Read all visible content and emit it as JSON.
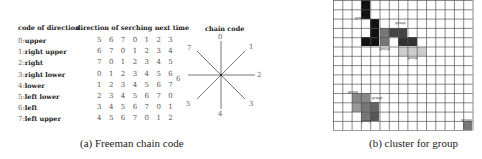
{
  "table": {
    "header_code": "code of direction",
    "header_dir": "direction of serching next time",
    "rows": [
      {
        "idx": "0:",
        "name": "upper",
        "seq": "5 6 7 0 1 2 3"
      },
      {
        "idx": "1:",
        "name": "right upper",
        "seq": "6 7 0 1 2 3 4"
      },
      {
        "idx": "2:",
        "name": "right",
        "seq": "7 0 1 2 3 4 5"
      },
      {
        "idx": "3:",
        "name": "right lower",
        "seq": "0 1 2 3 4 5 6"
      },
      {
        "idx": "4:",
        "name": "lower",
        "seq": "1 2 3 4 5 6 7"
      },
      {
        "idx": "5:",
        "name": "left lower",
        "seq": "2 3 4 5 6 7 0"
      },
      {
        "idx": "6:",
        "name": "left",
        "seq": "3 4 5 6 7 0 1"
      },
      {
        "idx": "7:",
        "name": "left upper",
        "seq": "4 5 6 7 0 1 2"
      }
    ]
  },
  "chain_code": {
    "title": "chain code",
    "directions": [
      "0",
      "1",
      "2",
      "3",
      "4",
      "5",
      "6",
      "7"
    ]
  },
  "grid": {
    "cols": 15,
    "rows": 14,
    "cell_size": 9.3,
    "filled": [
      {
        "c": 3,
        "r": 0,
        "color": "#111111"
      },
      {
        "c": 3,
        "r": 1,
        "color": "#111111"
      },
      {
        "c": 4,
        "r": 2,
        "color": "#111111"
      },
      {
        "c": 4,
        "r": 3,
        "color": "#111111"
      },
      {
        "c": 3,
        "r": 4,
        "color": "#111111"
      },
      {
        "c": 4,
        "r": 4,
        "color": "#111111"
      },
      {
        "c": 5,
        "r": 3,
        "color": "#777777"
      },
      {
        "c": 5,
        "r": 4,
        "color": "#777777"
      },
      {
        "c": 6,
        "r": 3,
        "color": "#444444"
      },
      {
        "c": 7,
        "r": 3,
        "color": "#444444"
      },
      {
        "c": 7,
        "r": 4,
        "color": "#333333"
      },
      {
        "c": 8,
        "r": 4,
        "color": "#333333"
      },
      {
        "c": 7,
        "r": 5,
        "color": "#cccccc"
      },
      {
        "c": 8,
        "r": 5,
        "color": "#cccccc"
      },
      {
        "c": 9,
        "r": 5,
        "color": "#cccccc"
      },
      {
        "c": 2,
        "r": 10,
        "color": "#888888"
      },
      {
        "c": 3,
        "r": 10,
        "color": "#888888"
      },
      {
        "c": 2,
        "r": 11,
        "color": "#999999"
      },
      {
        "c": 3,
        "r": 11,
        "color": "#777777"
      },
      {
        "c": 4,
        "r": 11,
        "color": "#666666"
      },
      {
        "c": 4,
        "r": 12,
        "color": "#555555"
      },
      {
        "c": 3,
        "r": 12,
        "color": "#777777"
      },
      {
        "c": 14,
        "r": 13,
        "color": "#777777"
      }
    ],
    "labels": [
      {
        "text": "group",
        "c": 2.4,
        "r": 1.7
      },
      {
        "text": "group",
        "c": 6.7,
        "r": 2.3
      },
      {
        "text": "group",
        "c": 5.0,
        "r": 5.0
      },
      {
        "text": "group",
        "c": 8.0,
        "r": 6.0
      },
      {
        "text": "group",
        "c": 1.6,
        "r": 9.7
      },
      {
        "text": "group",
        "c": 4.2,
        "r": 10.3
      },
      {
        "text": "group",
        "c": 3.0,
        "r": 12.8
      },
      {
        "text": "group",
        "c": 13.8,
        "r": 12.7
      }
    ]
  },
  "captions": {
    "a": "(a) Freeman chain code",
    "b": "(b) cluster for group"
  }
}
